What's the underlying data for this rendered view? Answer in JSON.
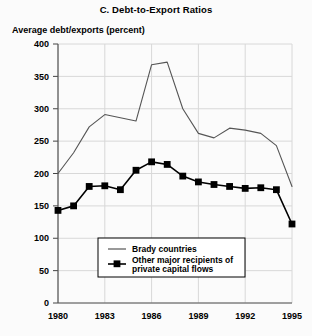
{
  "chart_data": {
    "type": "line",
    "title": "C. Debt-to-Export Ratios",
    "ylabel": "Average debt/exports (percent)",
    "xlabel": "",
    "ylim": [
      0,
      400
    ],
    "ytickstep": 50,
    "yticks": [
      "0",
      "50",
      "100",
      "150",
      "200",
      "250",
      "300",
      "350",
      "400"
    ],
    "xlim": [
      1980,
      1995
    ],
    "xticks": [
      "1980",
      "1983",
      "1986",
      "1989",
      "1992",
      "1995"
    ],
    "x": [
      1980,
      1981,
      1982,
      1983,
      1984,
      1985,
      1986,
      1987,
      1988,
      1989,
      1990,
      1991,
      1992,
      1993,
      1994,
      1995
    ],
    "grid": "on",
    "legend_position": "lower-center",
    "series": [
      {
        "name": "Brady countries",
        "marker": "none",
        "color": "#555555",
        "values": [
          200,
          232,
          272,
          291,
          286,
          281,
          368,
          372,
          300,
          262,
          255,
          270,
          267,
          262,
          243,
          180
        ]
      },
      {
        "name": "Other major recipients of private capital flows",
        "marker": "square",
        "color": "#000000",
        "values": [
          143,
          150,
          180,
          181,
          175,
          205,
          218,
          214,
          196,
          187,
          183,
          180,
          177,
          178,
          175,
          122
        ]
      }
    ]
  },
  "legend": {
    "entries": [
      {
        "label": "Brady countries",
        "marker": "none"
      },
      {
        "label_line1": "Other major recipients of",
        "label_line2": "private capital flows",
        "marker": "square"
      }
    ]
  }
}
